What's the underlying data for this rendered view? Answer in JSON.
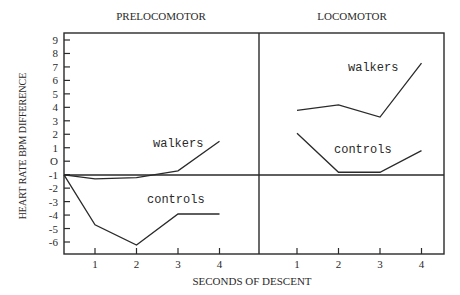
{
  "chart_data": {
    "type": "line",
    "title": "",
    "xlabel": "SECONDS OF DESCENT",
    "ylabel": "HEART RATE BPM DIFFERENCE",
    "ylim": [
      -6,
      9
    ],
    "yticks": [
      "9",
      "8",
      "7",
      "6",
      "5",
      "4",
      "3",
      "2",
      "1",
      "O",
      "-1",
      "-2",
      "-3",
      "-4",
      "-5",
      "-6"
    ],
    "baseline": -0.5,
    "grid": false,
    "panels": [
      {
        "title": "PRELOCOMOTOR",
        "x": [
          0,
          1,
          2,
          3,
          4
        ],
        "xticks": [
          "1",
          "2",
          "3",
          "4"
        ],
        "series": [
          {
            "name": "walkers",
            "values": [
              -0.5,
              -0.8,
              -0.7,
              -0.2,
              2.0
            ]
          },
          {
            "name": "controls",
            "values": [
              -0.5,
              -4.2,
              -5.7,
              -3.4,
              -3.4
            ]
          }
        ]
      },
      {
        "title": "LOCOMOTOR",
        "x": [
          1,
          2,
          3,
          4
        ],
        "xticks": [
          "1",
          "2",
          "3",
          "4"
        ],
        "series": [
          {
            "name": "walkers",
            "values": [
              4.3,
              4.7,
              3.8,
              7.8
            ]
          },
          {
            "name": "controls",
            "values": [
              2.6,
              -0.3,
              -0.3,
              1.3
            ]
          }
        ]
      }
    ]
  },
  "labels": {
    "panel_left": "PRELOCOMOTOR",
    "panel_right": "LOCOMOTOR",
    "x_axis": "SECONDS OF DESCENT",
    "y_axis": "HEART RATE BPM DIFFERENCE",
    "left_walkers": "walkers",
    "left_controls": "controls",
    "right_walkers": "walkers",
    "right_controls": "controls"
  }
}
